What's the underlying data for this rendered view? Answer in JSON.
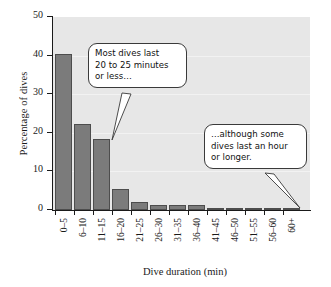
{
  "chart_data": {
    "type": "bar",
    "title": "",
    "subtitle": "",
    "xlabel": "Dive duration (min)",
    "ylabel": "Percentage of dives",
    "categories": [
      "0–5",
      "6–10",
      "11–15",
      "16–20",
      "21–25",
      "26–30",
      "31–35",
      "36–40",
      "41–45",
      "46–50",
      "51–55",
      "56–60",
      "60+"
    ],
    "values": [
      40.3,
      22.3,
      18.4,
      5.4,
      2.2,
      1.3,
      1.3,
      1.3,
      0.5,
      0.5,
      0.5,
      0.6,
      0.6
    ],
    "ylim": [
      0,
      50
    ],
    "yticks": [
      0,
      10,
      20,
      30,
      40,
      50
    ],
    "ytick_labels": [
      "0",
      "10",
      "20",
      "30",
      "40",
      "50"
    ],
    "grid": true,
    "legend": "none",
    "bar_color": "#7b7b7b",
    "bar_edge_color": "#4d4d4d",
    "plot_background": "#e7e7e7",
    "axis_color": "#1a1a1a",
    "annotations": [
      {
        "name": "callout-most-dives",
        "lines": [
          "Most dives last",
          "20 to 25 minutes",
          "or less…"
        ],
        "points_to_category": "16–20"
      },
      {
        "name": "callout-although-some",
        "lines": [
          "…although some",
          "dives last an hour",
          "or longer."
        ],
        "points_to_category": "60+"
      }
    ]
  }
}
